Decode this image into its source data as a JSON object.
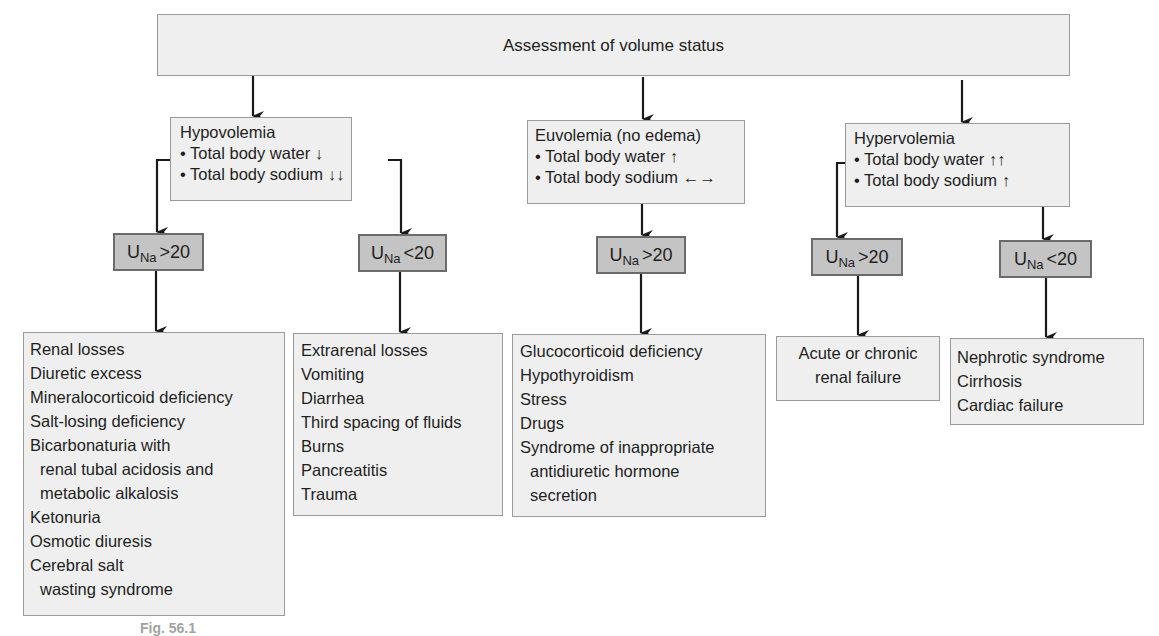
{
  "root": {
    "label": "Assessment of volume status"
  },
  "categories": [
    {
      "title": "Hypovolemia",
      "bullets": [
        "• Total body water ↓",
        "• Total body sodium ↓↓"
      ],
      "branches": [
        {
          "una_label": "U",
          "una_sub": "Na",
          "una_cond": ">20",
          "causes": [
            "Renal losses",
            "Diuretic excess",
            "Mineralocorticoid deficiency",
            "Salt-losing deficiency",
            "Bicarbonaturia with",
            "renal tubal acidosis and",
            "metabolic alkalosis",
            "Ketonuria",
            "Osmotic diuresis",
            "Cerebral salt",
            "wasting syndrome"
          ]
        },
        {
          "una_label": "U",
          "una_sub": "Na",
          "una_cond": "<20",
          "causes": [
            "Extrarenal losses",
            "Vomiting",
            "Diarrhea",
            "Third spacing of fluids",
            "Burns",
            "Pancreatitis",
            "Trauma"
          ]
        }
      ]
    },
    {
      "title": "Euvolemia (no edema)",
      "bullets": [
        "• Total body water ↑",
        "• Total body sodium ←→"
      ],
      "branches": [
        {
          "una_label": "U",
          "una_sub": "Na",
          "una_cond": ">20",
          "causes": [
            "Glucocorticoid deficiency",
            "Hypothyroidism",
            "Stress",
            "Drugs",
            "Syndrome of inappropriate",
            "antidiuretic hormone",
            "secretion"
          ]
        }
      ]
    },
    {
      "title": "Hypervolemia",
      "bullets": [
        "• Total body water ↑↑",
        "• Total body sodium ↑"
      ],
      "branches": [
        {
          "una_label": "U",
          "una_sub": "Na",
          "una_cond": ">20",
          "causes": [
            "Acute or chronic",
            "renal failure"
          ]
        },
        {
          "una_label": "U",
          "una_sub": "Na",
          "una_cond": "<20",
          "causes": [
            "Nephrotic syndrome",
            "Cirrhosis",
            "Cardiac failure"
          ]
        }
      ]
    }
  ],
  "caption": "Fig. 56.1"
}
